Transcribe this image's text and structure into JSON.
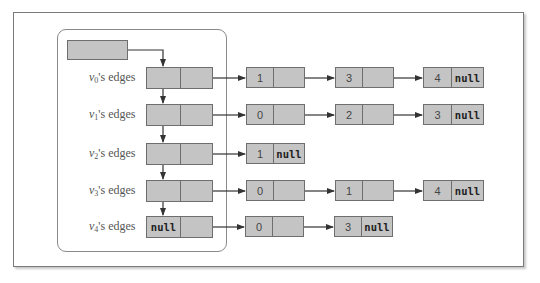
{
  "diagram": {
    "head_pointer": {
      "label": ""
    },
    "vertices": [
      {
        "id": "v0",
        "label_var": "v",
        "label_sub": "0",
        "label_suffix": "'s edges",
        "first_cell": "",
        "edges": [
          "1",
          "3",
          "4"
        ]
      },
      {
        "id": "v1",
        "label_var": "v",
        "label_sub": "1",
        "label_suffix": "'s edges",
        "first_cell": "",
        "edges": [
          "0",
          "2",
          "3"
        ]
      },
      {
        "id": "v2",
        "label_var": "v",
        "label_sub": "2",
        "label_suffix": "'s edges",
        "first_cell": "",
        "edges": [
          "1"
        ]
      },
      {
        "id": "v3",
        "label_var": "v",
        "label_sub": "3",
        "label_suffix": "'s edges",
        "first_cell": "",
        "edges": [
          "0",
          "1",
          "4"
        ]
      },
      {
        "id": "v4",
        "label_var": "v",
        "label_sub": "4",
        "label_suffix": "'s edges",
        "first_cell": "null",
        "edges": [
          "0",
          "3"
        ]
      }
    ],
    "null_label": "null",
    "colors": {
      "node_fill": "#c4c4c4",
      "node_border": "#6e6e6e",
      "arrow": "#333333",
      "frame": "#7a7a7a"
    }
  }
}
